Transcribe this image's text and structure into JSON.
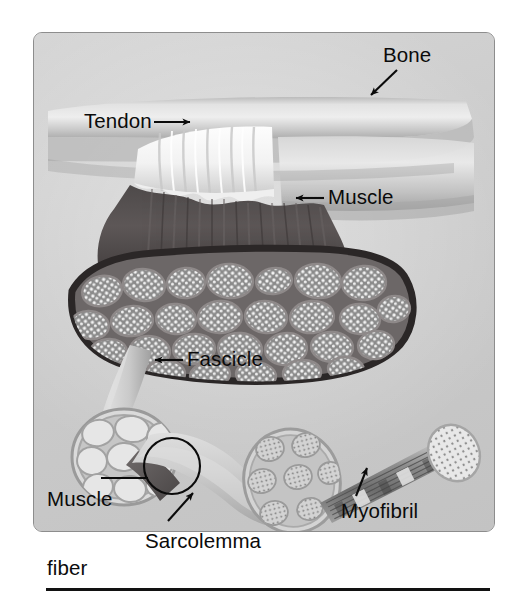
{
  "figure": {
    "background_color": "#ffffff",
    "panel_color": "#cfcfcf",
    "panel_border_color": "#8d8d8d",
    "rule_color": "#121212",
    "label_color": "#0b0b0b"
  },
  "labels": {
    "bone": "Bone",
    "tendon": "Tendon",
    "muscle": "Muscle",
    "fascicle": "Fascicle",
    "muscle_fiber_line1": "Muscle",
    "muscle_fiber_line2": "fiber",
    "sarcolemma": "Sarcolemma",
    "myofibril": "Myofibril"
  },
  "annotations": [
    {
      "label": "Bone",
      "pointer": "arrow",
      "direction": "down-left",
      "target": "bone-shaft"
    },
    {
      "label": "Tendon",
      "pointer": "arrow",
      "direction": "right",
      "target": "tendon-band"
    },
    {
      "label": "Muscle",
      "pointer": "arrow",
      "direction": "left",
      "target": "muscle-belly"
    },
    {
      "label": "Fascicle",
      "pointer": "arrow",
      "direction": "left",
      "target": "fascicle-tube"
    },
    {
      "label": "Muscle fiber",
      "pointer": "leader-line-circle",
      "direction": "right",
      "target": "muscle-fiber-tube"
    },
    {
      "label": "Sarcolemma",
      "pointer": "arrow",
      "direction": "up-right",
      "target": "fiber-membrane"
    },
    {
      "label": "Myofibril",
      "pointer": "arrow",
      "direction": "up",
      "target": "myofibril-strand"
    }
  ],
  "structures": [
    {
      "name": "bone",
      "description": "Long bone shaft running horizontally across upper panel"
    },
    {
      "name": "tendon",
      "description": "White ridged band joining muscle to bone"
    },
    {
      "name": "muscle",
      "description": "Dark striated muscle belly with cut cross-section"
    },
    {
      "name": "muscle-cross-section",
      "description": "Cut face showing many packed fascicles",
      "fascicle_count": 34
    },
    {
      "name": "fascicle",
      "description": "Tapered bundle of muscle fibers drawn pulled out from the muscle",
      "fiber_count": 11
    },
    {
      "name": "muscle-fiber",
      "description": "Single curved muscle cell with cut end showing myofibril bundles",
      "myofibril_group_count": 7
    },
    {
      "name": "myofibril",
      "description": "Striated strand extending to the right ending in a dotted myofilament face"
    }
  ],
  "icons": {
    "arrow": "arrow-icon",
    "leader_circle": "circle-callout-icon"
  }
}
